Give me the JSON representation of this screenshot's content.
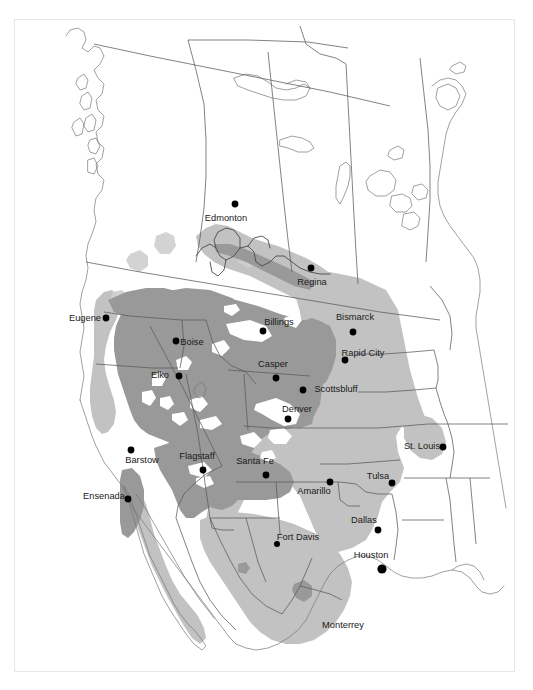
{
  "figure": {
    "kind": "range-distribution-map",
    "region": "Western North America",
    "frame_border_color": "#e6e6e6",
    "background_color": "#ffffff"
  },
  "palette": {
    "core_range_gray": "#999999",
    "peripheral_range_gray": "#c2c2c2",
    "light_fill_gray": "#cfcfcf",
    "white_gap": "#ffffff",
    "boundary_line": "#5a5a5a",
    "coast_line": "#6e6e6e",
    "river_line": "#4a4a4a",
    "label_text": "#1a1a1a",
    "dot_color": "#000000"
  },
  "map": {
    "cities": [
      {
        "name": "Edmonton",
        "label_x": 226,
        "label_y": 221,
        "anchor": "middle",
        "dot_x": 235,
        "dot_y": 204,
        "dot_r": 3.4
      },
      {
        "name": "Regina",
        "label_x": 312,
        "label_y": 285,
        "anchor": "middle",
        "dot_x": 311,
        "dot_y": 268,
        "dot_r": 3.4
      },
      {
        "name": "Bismarck",
        "label_x": 355,
        "label_y": 320,
        "anchor": "middle",
        "dot_x": 353,
        "dot_y": 332,
        "dot_r": 3.4
      },
      {
        "name": "Eugene",
        "label_x": 85,
        "label_y": 321,
        "anchor": "middle",
        "dot_x": 106,
        "dot_y": 318,
        "dot_r": 3.4
      },
      {
        "name": "Billings",
        "label_x": 279,
        "label_y": 325,
        "anchor": "middle",
        "dot_x": 263,
        "dot_y": 331,
        "dot_r": 3.4
      },
      {
        "name": "Boise",
        "label_x": 192,
        "label_y": 345,
        "anchor": "middle",
        "dot_x": 176,
        "dot_y": 341,
        "dot_r": 3.4
      },
      {
        "name": "Rapid City",
        "label_x": 363,
        "label_y": 356,
        "anchor": "middle",
        "dot_x": 345,
        "dot_y": 360,
        "dot_r": 3.4
      },
      {
        "name": "Casper",
        "label_x": 273,
        "label_y": 367,
        "anchor": "middle",
        "dot_x": 276,
        "dot_y": 378,
        "dot_r": 3.4
      },
      {
        "name": "Elko",
        "label_x": 160,
        "label_y": 378,
        "anchor": "middle",
        "dot_x": 179,
        "dot_y": 376,
        "dot_r": 3.4
      },
      {
        "name": "Scottsbluff",
        "label_x": 336,
        "label_y": 392,
        "anchor": "middle",
        "dot_x": 303,
        "dot_y": 390,
        "dot_r": 3.4
      },
      {
        "name": "Denver",
        "label_x": 297,
        "label_y": 412,
        "anchor": "middle",
        "dot_x": 288,
        "dot_y": 419,
        "dot_r": 3.4
      },
      {
        "name": "St. Louis",
        "label_x": 422,
        "label_y": 449,
        "anchor": "middle",
        "dot_x": 443,
        "dot_y": 447,
        "dot_r": 3.4
      },
      {
        "name": "Barstow",
        "label_x": 142,
        "label_y": 463,
        "anchor": "middle",
        "dot_x": 131,
        "dot_y": 450,
        "dot_r": 3.4
      },
      {
        "name": "Flagstaff",
        "label_x": 197,
        "label_y": 459,
        "anchor": "middle",
        "dot_x": 203,
        "dot_y": 470,
        "dot_r": 3.4
      },
      {
        "name": "Santa Fe",
        "label_x": 255,
        "label_y": 464,
        "anchor": "middle",
        "dot_x": 266,
        "dot_y": 475,
        "dot_r": 3.4
      },
      {
        "name": "Tulsa",
        "label_x": 378,
        "label_y": 479,
        "anchor": "middle",
        "dot_x": 392,
        "dot_y": 483,
        "dot_r": 3.4
      },
      {
        "name": "Amarillo",
        "label_x": 314,
        "label_y": 494,
        "anchor": "middle",
        "dot_x": 330,
        "dot_y": 482,
        "dot_r": 3.4
      },
      {
        "name": "Ensenada",
        "label_x": 104,
        "label_y": 499,
        "anchor": "middle",
        "dot_x": 128,
        "dot_y": 499,
        "dot_r": 3.4
      },
      {
        "name": "Dallas",
        "label_x": 364,
        "label_y": 523,
        "anchor": "middle",
        "dot_x": 378,
        "dot_y": 530,
        "dot_r": 3.4
      },
      {
        "name": "Fort Davis",
        "label_x": 298,
        "label_y": 540,
        "anchor": "middle",
        "dot_x": 277,
        "dot_y": 544,
        "dot_r": 3.0
      },
      {
        "name": "Houston",
        "label_x": 371,
        "label_y": 558,
        "anchor": "middle",
        "dot_x": 382,
        "dot_y": 569,
        "dot_r": 4.6
      },
      {
        "name": "Monterrey",
        "label_x": 343,
        "label_y": 628,
        "anchor": "middle",
        "dot_x": 0,
        "dot_y": 0,
        "dot_r": 0
      }
    ]
  }
}
